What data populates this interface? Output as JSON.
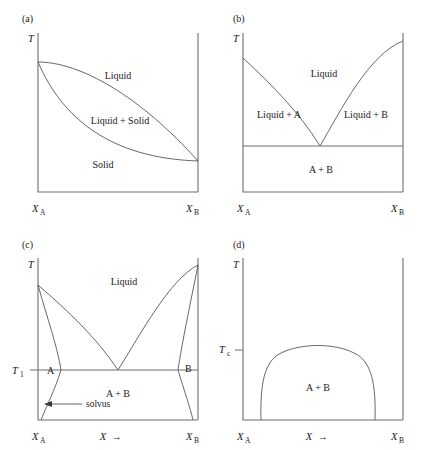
{
  "figure": {
    "panels": [
      {
        "key": "a",
        "label": "(a)",
        "type": "lens-solid-solution",
        "y_axis_label": "T",
        "x_left_label": "X",
        "x_left_sub": "A",
        "x_right_label": "X",
        "x_right_sub": "B",
        "x_axis_label": "",
        "x_axis_arrow": "",
        "regions": [
          "Liquid",
          "Liquid + Solid",
          "Solid"
        ],
        "region_liquid": "Liquid",
        "region_mixed": "Liquid + Solid",
        "region_solid": "Solid"
      },
      {
        "key": "b",
        "label": "(b)",
        "type": "simple-eutectic",
        "y_axis_label": "T",
        "x_left_label": "X",
        "x_left_sub": "A",
        "x_right_label": "X",
        "x_right_sub": "B",
        "x_axis_label": "",
        "x_axis_arrow": "",
        "regions": [
          "Liquid",
          "Liquid + A",
          "Liquid + B",
          "A + B"
        ],
        "region_liquid": "Liquid",
        "region_left": "Liquid + A",
        "region_right": "Liquid + B",
        "region_bottom": "A + B"
      },
      {
        "key": "c",
        "label": "(c)",
        "type": "eutectic-with-terminal-solid-solutions",
        "y_axis_label": "T",
        "x_left_label": "X",
        "x_left_sub": "A",
        "x_right_label": "X",
        "x_right_sub": "B",
        "x_axis_label": "X",
        "x_axis_arrow": "→",
        "temperature_marker": "T",
        "temperature_marker_sub": "1",
        "phase_left": "A",
        "phase_right": "B",
        "region_liquid": "Liquid",
        "region_bottom": "A + B",
        "annotation": "solvus"
      },
      {
        "key": "d",
        "label": "(d)",
        "type": "miscibility-gap",
        "y_axis_label": "T",
        "x_left_label": "X",
        "x_left_sub": "A",
        "x_right_label": "X",
        "x_right_sub": "B",
        "x_axis_label": "X",
        "x_axis_arrow": "→",
        "temperature_marker": "T",
        "temperature_marker_sub": "c",
        "region_bottom": "A + B"
      }
    ]
  },
  "colors": {
    "background": "#ffffff",
    "axis": "#6e6e6e",
    "curve": "#4d4d4d",
    "text": "#1a1a1a"
  }
}
